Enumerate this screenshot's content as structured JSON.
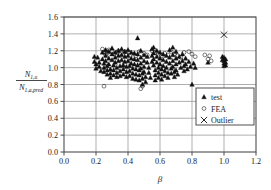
{
  "chart_data": {
    "type": "scatter",
    "title": "",
    "xlabel": "β",
    "ylabel_numerator": "N",
    "ylabel_numerator_sub": "1,u",
    "ylabel_denominator": "N",
    "ylabel_denominator_sub": "1,a,pred",
    "xlim": [
      0.0,
      1.2
    ],
    "ylim": [
      0.0,
      1.6
    ],
    "xticks": [
      "0.0",
      "0.2",
      "0.4",
      "0.6",
      "0.8",
      "1.0",
      "1.2"
    ],
    "yticks": [
      "0.0",
      "0.2",
      "0.4",
      "0.6",
      "0.8",
      "1.0",
      "1.2",
      "1.4",
      "1.6"
    ],
    "xtick_values": [
      0.0,
      0.2,
      0.4,
      0.6,
      0.8,
      1.0,
      1.2
    ],
    "ytick_values": [
      0.0,
      0.2,
      0.4,
      0.6,
      0.8,
      1.0,
      1.2,
      1.4,
      1.6
    ],
    "grid": true,
    "grid_color": "#8c8c8c",
    "marker_color": "#111111",
    "legend_position": "lower-right-inside",
    "series": [
      {
        "name": "test",
        "marker": "triangle",
        "points": [
          [
            0.19,
            1.13
          ],
          [
            0.19,
            1.07
          ],
          [
            0.2,
            1.04
          ],
          [
            0.2,
            0.99
          ],
          [
            0.21,
            1.12
          ],
          [
            0.22,
            1.06
          ],
          [
            0.22,
            1.01
          ],
          [
            0.23,
            0.96
          ],
          [
            0.24,
            1.18
          ],
          [
            0.24,
            1.1
          ],
          [
            0.25,
            1.05
          ],
          [
            0.25,
            1.0
          ],
          [
            0.25,
            0.95
          ],
          [
            0.26,
            1.21
          ],
          [
            0.26,
            1.14
          ],
          [
            0.26,
            1.08
          ],
          [
            0.27,
            1.02
          ],
          [
            0.27,
            0.97
          ],
          [
            0.27,
            0.92
          ],
          [
            0.28,
            1.19
          ],
          [
            0.28,
            1.11
          ],
          [
            0.28,
            1.04
          ],
          [
            0.29,
            0.98
          ],
          [
            0.29,
            0.93
          ],
          [
            0.29,
            0.88
          ],
          [
            0.3,
            1.23
          ],
          [
            0.3,
            1.16
          ],
          [
            0.3,
            1.09
          ],
          [
            0.31,
            1.03
          ],
          [
            0.31,
            0.97
          ],
          [
            0.31,
            0.91
          ],
          [
            0.32,
            1.18
          ],
          [
            0.32,
            1.12
          ],
          [
            0.32,
            1.06
          ],
          [
            0.33,
            1.0
          ],
          [
            0.33,
            0.94
          ],
          [
            0.33,
            0.89
          ],
          [
            0.34,
            1.2
          ],
          [
            0.34,
            1.14
          ],
          [
            0.34,
            1.08
          ],
          [
            0.35,
            1.02
          ],
          [
            0.35,
            0.96
          ],
          [
            0.35,
            0.9
          ],
          [
            0.36,
            1.22
          ],
          [
            0.36,
            1.15
          ],
          [
            0.36,
            1.09
          ],
          [
            0.37,
            1.03
          ],
          [
            0.37,
            0.98
          ],
          [
            0.37,
            0.92
          ],
          [
            0.38,
            1.19
          ],
          [
            0.38,
            1.13
          ],
          [
            0.38,
            1.07
          ],
          [
            0.39,
            1.01
          ],
          [
            0.39,
            0.95
          ],
          [
            0.39,
            0.89
          ],
          [
            0.4,
            1.21
          ],
          [
            0.4,
            1.14
          ],
          [
            0.4,
            1.08
          ],
          [
            0.41,
            1.02
          ],
          [
            0.41,
            0.96
          ],
          [
            0.41,
            0.9
          ],
          [
            0.42,
            1.18
          ],
          [
            0.42,
            1.11
          ],
          [
            0.42,
            1.05
          ],
          [
            0.43,
            0.99
          ],
          [
            0.43,
            0.93
          ],
          [
            0.43,
            0.87
          ],
          [
            0.44,
            1.17
          ],
          [
            0.44,
            1.1
          ],
          [
            0.44,
            1.04
          ],
          [
            0.45,
            0.98
          ],
          [
            0.45,
            0.92
          ],
          [
            0.45,
            0.86
          ],
          [
            0.46,
            1.35
          ],
          [
            0.46,
            1.16
          ],
          [
            0.46,
            1.09
          ],
          [
            0.46,
            1.03
          ],
          [
            0.47,
            0.97
          ],
          [
            0.47,
            0.91
          ],
          [
            0.47,
            0.85
          ],
          [
            0.48,
            1.2
          ],
          [
            0.48,
            1.12
          ],
          [
            0.48,
            1.05
          ],
          [
            0.48,
            0.99
          ],
          [
            0.49,
            0.93
          ],
          [
            0.49,
            0.87
          ],
          [
            0.49,
            0.8
          ],
          [
            0.5,
            1.15
          ],
          [
            0.5,
            1.08
          ],
          [
            0.5,
            1.01
          ],
          [
            0.5,
            0.95
          ],
          [
            0.51,
            0.89
          ],
          [
            0.51,
            0.83
          ],
          [
            0.52,
            1.13
          ],
          [
            0.52,
            1.06
          ],
          [
            0.53,
            1.0
          ],
          [
            0.53,
            0.94
          ],
          [
            0.54,
            0.88
          ],
          [
            0.55,
            1.22
          ],
          [
            0.55,
            1.14
          ],
          [
            0.55,
            1.07
          ],
          [
            0.56,
            1.24
          ],
          [
            0.56,
            1.17
          ],
          [
            0.56,
            1.1
          ],
          [
            0.56,
            1.03
          ],
          [
            0.57,
            0.97
          ],
          [
            0.57,
            0.91
          ],
          [
            0.57,
            0.85
          ],
          [
            0.58,
            1.2
          ],
          [
            0.58,
            1.13
          ],
          [
            0.58,
            1.06
          ],
          [
            0.59,
            1.0
          ],
          [
            0.59,
            0.94
          ],
          [
            0.59,
            0.88
          ],
          [
            0.6,
            1.18
          ],
          [
            0.6,
            1.11
          ],
          [
            0.6,
            1.04
          ],
          [
            0.61,
            0.98
          ],
          [
            0.61,
            0.92
          ],
          [
            0.61,
            0.86
          ],
          [
            0.62,
            1.16
          ],
          [
            0.62,
            1.09
          ],
          [
            0.62,
            1.02
          ],
          [
            0.63,
            0.96
          ],
          [
            0.63,
            0.9
          ],
          [
            0.64,
            1.14
          ],
          [
            0.64,
            1.07
          ],
          [
            0.64,
            1.0
          ],
          [
            0.65,
            0.94
          ],
          [
            0.65,
            0.88
          ],
          [
            0.66,
            1.21
          ],
          [
            0.66,
            1.12
          ],
          [
            0.66,
            1.05
          ],
          [
            0.67,
            0.99
          ],
          [
            0.67,
            0.93
          ],
          [
            0.68,
            1.24
          ],
          [
            0.68,
            1.15
          ],
          [
            0.68,
            1.08
          ],
          [
            0.68,
            1.01
          ],
          [
            0.69,
            0.95
          ],
          [
            0.69,
            0.89
          ],
          [
            0.7,
            1.19
          ],
          [
            0.7,
            1.11
          ],
          [
            0.7,
            1.04
          ],
          [
            0.7,
            0.97
          ],
          [
            0.71,
            0.92
          ],
          [
            0.72,
            1.13
          ],
          [
            0.72,
            1.06
          ],
          [
            0.73,
            1.0
          ],
          [
            0.74,
            1.16
          ],
          [
            0.74,
            1.08
          ],
          [
            0.75,
            1.02
          ],
          [
            0.75,
            0.96
          ],
          [
            0.76,
            1.11
          ],
          [
            0.76,
            1.04
          ],
          [
            0.77,
            0.98
          ],
          [
            0.78,
            1.07
          ],
          [
            0.79,
            1.01
          ],
          [
            0.8,
            0.8
          ],
          [
            0.81,
            1.05
          ],
          [
            0.82,
            1.0
          ],
          [
            0.9,
            1.06
          ],
          [
            0.99,
            1.13
          ],
          [
            0.99,
            1.09
          ],
          [
            1.0,
            1.12
          ],
          [
            1.0,
            1.08
          ],
          [
            1.0,
            1.05
          ],
          [
            1.0,
            1.02
          ],
          [
            1.01,
            1.1
          ],
          [
            1.01,
            1.06
          ],
          [
            1.01,
            1.03
          ]
        ]
      },
      {
        "name": "FEA",
        "marker": "circle",
        "points": [
          [
            0.24,
            1.22
          ],
          [
            0.25,
            1.18
          ],
          [
            0.25,
            0.78
          ],
          [
            0.26,
            1.2
          ],
          [
            0.26,
            1.15
          ],
          [
            0.27,
            1.17
          ],
          [
            0.28,
            1.21
          ],
          [
            0.3,
            1.19
          ],
          [
            0.31,
            1.16
          ],
          [
            0.33,
            1.18
          ],
          [
            0.34,
            1.2
          ],
          [
            0.36,
            1.17
          ],
          [
            0.38,
            1.19
          ],
          [
            0.39,
            1.15
          ],
          [
            0.41,
            1.18
          ],
          [
            0.43,
            1.16
          ],
          [
            0.45,
            1.14
          ],
          [
            0.47,
            1.19
          ],
          [
            0.48,
            0.75
          ],
          [
            0.49,
            0.78
          ],
          [
            0.5,
            1.17
          ],
          [
            0.52,
            1.15
          ],
          [
            0.55,
            1.2
          ],
          [
            0.57,
            1.18
          ],
          [
            0.59,
            1.16
          ],
          [
            0.61,
            1.14
          ],
          [
            0.63,
            1.17
          ],
          [
            0.65,
            1.15
          ],
          [
            0.67,
            1.19
          ],
          [
            0.69,
            1.16
          ],
          [
            0.71,
            1.14
          ],
          [
            0.73,
            1.12
          ],
          [
            0.75,
            1.18
          ],
          [
            0.78,
            1.19
          ],
          [
            0.8,
            1.16
          ],
          [
            0.82,
            1.13
          ],
          [
            0.88,
            1.15
          ],
          [
            0.9,
            1.1
          ],
          [
            0.91,
            1.14
          ],
          [
            0.92,
            1.08
          ]
        ]
      },
      {
        "name": "Outlier",
        "marker": "x",
        "points": [
          [
            1.0,
            1.39
          ]
        ]
      }
    ]
  },
  "legend": {
    "entries": [
      {
        "label": "test",
        "marker": "triangle"
      },
      {
        "label": "FEA",
        "marker": "circle"
      },
      {
        "label": "Outlier",
        "marker": "x"
      }
    ]
  }
}
